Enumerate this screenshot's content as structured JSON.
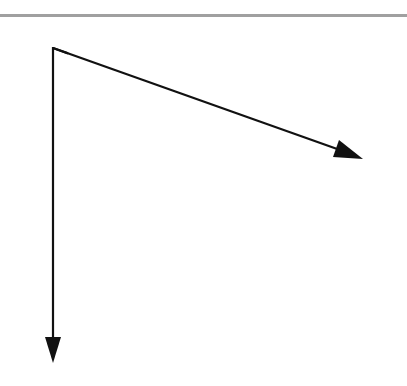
{
  "diagram": {
    "type": "vector-axes",
    "origin": [
      53,
      48
    ],
    "vectors": [
      {
        "name": "diagonal-vector",
        "from": [
          53,
          48
        ],
        "to": [
          362,
          158
        ]
      },
      {
        "name": "vertical-vector",
        "from": [
          53,
          48
        ],
        "to": [
          53,
          362
        ]
      }
    ],
    "colors": {
      "stroke": "#111111",
      "rule": "#a0a0a0",
      "background": "#ffffff"
    }
  }
}
